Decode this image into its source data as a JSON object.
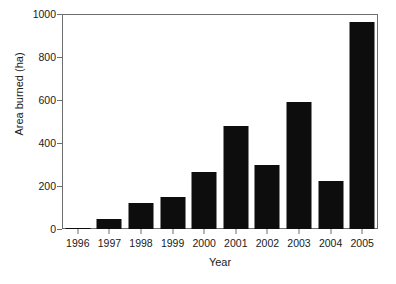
{
  "chart_data": {
    "type": "bar",
    "title": "",
    "subtitle": "",
    "xlabel": "Year",
    "ylabel": "Area burned (ha)",
    "categories": [
      "1996",
      "1997",
      "1998",
      "1999",
      "2000",
      "2001",
      "2002",
      "2003",
      "2004",
      "2005"
    ],
    "values": [
      3,
      47,
      122,
      150,
      267,
      477,
      300,
      590,
      225,
      963
    ],
    "series": [
      {
        "name": "Area burned",
        "values": [
          3,
          47,
          122,
          150,
          267,
          477,
          300,
          590,
          225,
          963
        ]
      }
    ],
    "ylim": [
      0,
      1000
    ],
    "y_ticks": [
      0,
      200,
      400,
      600,
      800,
      1000
    ],
    "y_tick_labels": [
      "0",
      "200",
      "400",
      "600",
      "800",
      "1000"
    ],
    "x_tick_labels": [
      "1996",
      "1997",
      "1998",
      "1999",
      "2000",
      "2001",
      "2002",
      "2003",
      "2004",
      "2005"
    ],
    "grid": false,
    "legend": false,
    "legend_position": "none",
    "bar_color": "#0d0d0d",
    "axis_color": "#6e6e6e",
    "background_color": "#ffffff",
    "annotations": []
  }
}
